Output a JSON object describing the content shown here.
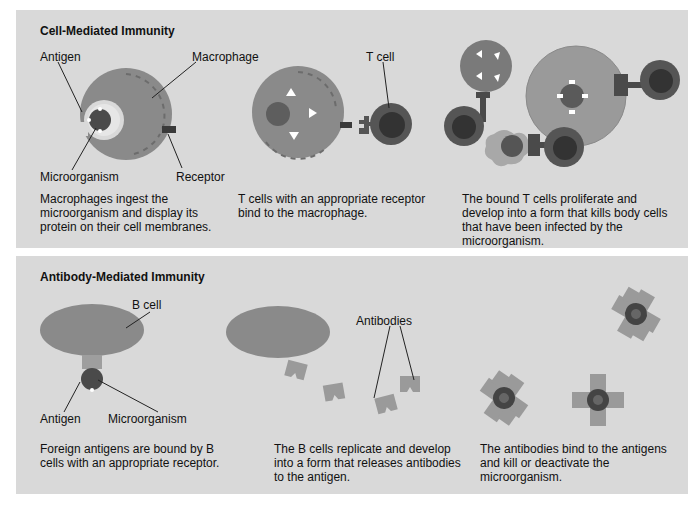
{
  "cell_mediated": {
    "title": "Cell-Mediated Immunity",
    "labels": {
      "antigen": "Antigen",
      "macrophage": "Macrophage",
      "microorganism": "Microorganism",
      "receptor": "Receptor",
      "t_cell": "T cell"
    },
    "captions": [
      "Macrophages ingest the microorganism and display its protein on their cell membranes.",
      "T cells with an appropriate receptor bind to the macrophage.",
      "The bound T cells proliferate and develop into a form that kills body cells that have been infected by the microorganism."
    ]
  },
  "antibody_mediated": {
    "title": "Antibody-Mediated Immunity",
    "labels": {
      "b_cell": "B cell",
      "antigen": "Antigen",
      "microorganism": "Microorganism",
      "antibodies": "Antibodies"
    },
    "captions": [
      "Foreign antigens are bound by B cells with an appropriate receptor.",
      "The B cells replicate and develop into a form that releases antibodies to the antigen.",
      "The antibodies bind to the antigens and kill or deactivate the microorganism."
    ]
  },
  "colors": {
    "panel_bg": "#d9d9d9",
    "cell": "#8a8a8a",
    "nucleus": "#5a5a5a",
    "dark": "#3a3a3a",
    "antibody": "#9a9a9a"
  }
}
